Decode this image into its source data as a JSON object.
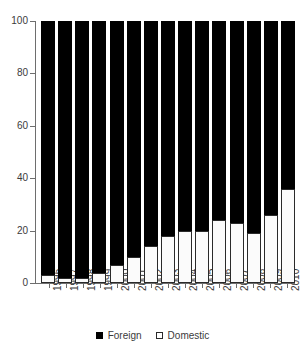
{
  "chart_data": {
    "type": "bar",
    "stacked": true,
    "percent": true,
    "title": "",
    "subtitle": "",
    "xlabel": "",
    "ylabel": "",
    "ylim": [
      0,
      100
    ],
    "yticks": [
      0,
      20,
      40,
      60,
      80,
      100
    ],
    "ytick_labels": [
      "0",
      "20",
      "40",
      "60",
      "80",
      "100"
    ],
    "grid": false,
    "legend_position": "bottom",
    "categories": [
      "1996",
      "1997",
      "1998",
      "1999",
      "2000",
      "2001",
      "2002",
      "2003",
      "2004",
      "2005",
      "2006",
      "2007",
      "2008",
      "2009",
      "2010"
    ],
    "series": [
      {
        "name": "Foreign",
        "color": "#000000",
        "values": [
          97,
          98,
          98,
          96,
          93,
          90,
          86,
          82,
          80,
          80,
          76,
          77,
          81,
          74,
          64
        ]
      },
      {
        "name": "Domestic",
        "color": "#ffffff",
        "values": [
          3,
          2,
          2,
          4,
          7,
          10,
          14,
          18,
          20,
          20,
          24,
          23,
          19,
          26,
          36
        ]
      }
    ]
  },
  "legend": {
    "items": [
      {
        "label": "Foreign",
        "swatch": "filled-square-icon"
      },
      {
        "label": "Domestic",
        "swatch": "hollow-square-icon"
      }
    ]
  }
}
